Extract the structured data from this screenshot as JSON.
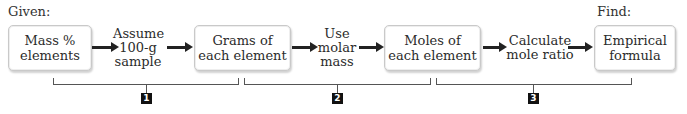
{
  "labels": {
    "given": "Given:",
    "find": "Find:"
  },
  "boxes": [
    {
      "line1": "Mass %",
      "line2": "elements"
    },
    {
      "line1": "Grams of",
      "line2": "each element"
    },
    {
      "line1": "Moles of",
      "line2": "each element"
    },
    {
      "line1": "Empirical",
      "line2": "formula"
    }
  ],
  "steps": [
    {
      "line1": "Assume",
      "line2": "100-g",
      "line3": "sample"
    },
    {
      "line1": "Use",
      "line2": "molar",
      "line3": "mass"
    },
    {
      "line1": "Calculate",
      "line2": "mole ratio"
    }
  ],
  "badges": [
    "1",
    "2",
    "3"
  ],
  "colors": {
    "arrow": "#222222",
    "badge_bg": "#111111",
    "box_border": "#c9c9c9",
    "bracket": "#555555"
  }
}
